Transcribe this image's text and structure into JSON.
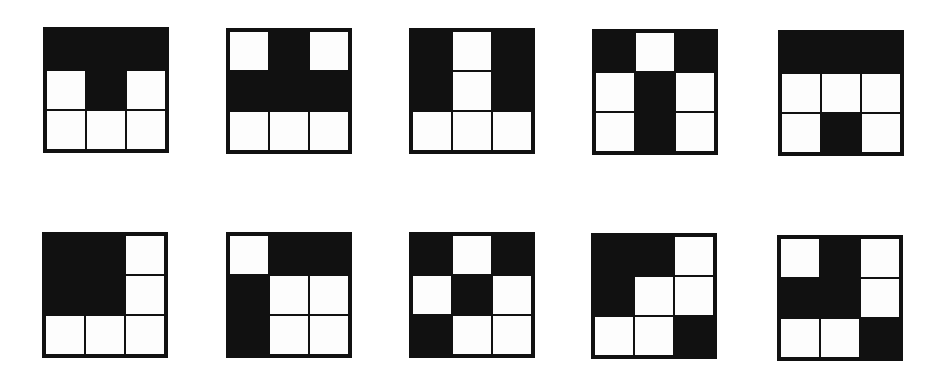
{
  "figure": {
    "colors": {
      "filled": "#111111",
      "empty": "#fdfdfd",
      "border": "#111111"
    },
    "rows": [
      {
        "grids": [
          {
            "id": "r1g1",
            "left": 43,
            "top": 27,
            "cells": [
              1,
              1,
              1,
              0,
              1,
              0,
              0,
              0,
              0
            ]
          },
          {
            "id": "r1g2",
            "left": 226,
            "top": 28,
            "cells": [
              0,
              1,
              0,
              1,
              1,
              1,
              0,
              0,
              0
            ]
          },
          {
            "id": "r1g3",
            "left": 409,
            "top": 28,
            "cells": [
              1,
              0,
              1,
              1,
              0,
              1,
              0,
              0,
              0
            ]
          },
          {
            "id": "r1g4",
            "left": 592,
            "top": 29,
            "cells": [
              1,
              0,
              1,
              0,
              1,
              0,
              0,
              1,
              0
            ]
          },
          {
            "id": "r1g5",
            "left": 778,
            "top": 30,
            "cells": [
              1,
              1,
              1,
              0,
              0,
              0,
              0,
              1,
              0
            ]
          }
        ]
      },
      {
        "grids": [
          {
            "id": "r2g1",
            "left": 42,
            "top": 232,
            "cells": [
              1,
              1,
              0,
              1,
              1,
              0,
              0,
              0,
              0
            ]
          },
          {
            "id": "r2g2",
            "left": 226,
            "top": 232,
            "cells": [
              0,
              1,
              1,
              1,
              0,
              0,
              1,
              0,
              0
            ]
          },
          {
            "id": "r2g3",
            "left": 409,
            "top": 232,
            "cells": [
              1,
              0,
              1,
              0,
              1,
              0,
              1,
              0,
              0
            ]
          },
          {
            "id": "r2g4",
            "left": 591,
            "top": 233,
            "cells": [
              1,
              1,
              0,
              1,
              0,
              0,
              0,
              0,
              1
            ]
          },
          {
            "id": "r2g5",
            "left": 777,
            "top": 235,
            "cells": [
              0,
              1,
              0,
              1,
              1,
              0,
              0,
              0,
              1
            ]
          }
        ]
      }
    ]
  }
}
